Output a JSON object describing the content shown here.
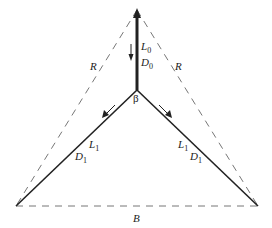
{
  "diagram": {
    "labels": {
      "stem_L": "L",
      "stem_L_sub": "0",
      "stem_D": "D",
      "stem_D_sub": "0",
      "junction": "β",
      "left_L": "L",
      "left_L_sub": "1",
      "left_D": "D",
      "left_D_sub": "1",
      "right_L": "L",
      "right_L_sub": "1",
      "right_D": "D",
      "right_D_sub": "1",
      "left_dashed": "R",
      "right_dashed": "R",
      "base_dashed": "B"
    },
    "colors": {
      "line": "#222222",
      "dashed": "#777777"
    }
  }
}
